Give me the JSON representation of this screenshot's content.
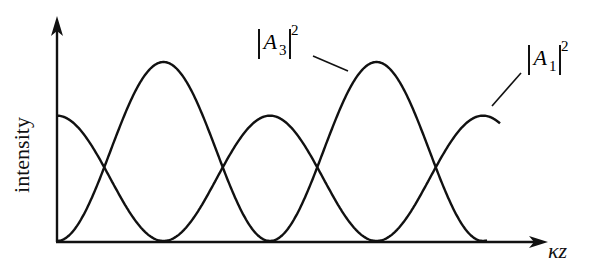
{
  "chart_data": {
    "type": "line",
    "title": "",
    "xlabel": "κz",
    "ylabel": "intensity",
    "grid": false,
    "legend": "inline curve labels with leader lines",
    "series": [
      {
        "name": "|A1|^2",
        "label": "A",
        "subscript": "1",
        "superscript": "2",
        "description": "starts at mid-height maximum, oscillates between 0 and ~0.72 of A3 peak",
        "x": [
          0,
          1,
          2,
          3,
          4
        ],
        "values": [
          0.7,
          0.0,
          0.7,
          0.0,
          0.7
        ]
      },
      {
        "name": "|A3|^2",
        "label": "A",
        "subscript": "3",
        "superscript": "2",
        "description": "starts at zero, peaks at full height, out of phase with |A1|^2",
        "x": [
          0,
          1,
          2,
          3,
          4
        ],
        "values": [
          0.0,
          1.0,
          0.0,
          1.0,
          0.0
        ]
      }
    ],
    "axis_arrows": true
  },
  "labels": {
    "y_axis": "intensity",
    "x_axis": "κz",
    "curve_a3": {
      "letter": "A",
      "sub": "3",
      "sup": "2"
    },
    "curve_a1": {
      "letter": "A",
      "sub": "1",
      "sup": "2"
    }
  },
  "colors": {
    "ink": "#111111",
    "background": "#ffffff"
  }
}
